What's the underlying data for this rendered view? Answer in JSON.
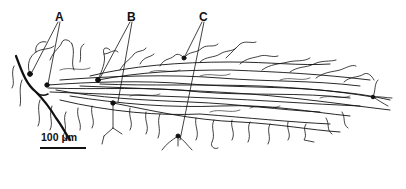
{
  "figure": {
    "type": "neuron dendrite tracing",
    "labels": [
      {
        "id": "A",
        "text": "A",
        "x": 55,
        "y": 11
      },
      {
        "id": "B",
        "text": "B",
        "x": 127,
        "y": 11
      },
      {
        "id": "C",
        "text": "C",
        "x": 199,
        "y": 11
      }
    ],
    "scale_bar": {
      "text": "100 μm",
      "length_px": 46
    },
    "colors": {
      "ink": "#111111",
      "background": "#ffffff"
    }
  }
}
